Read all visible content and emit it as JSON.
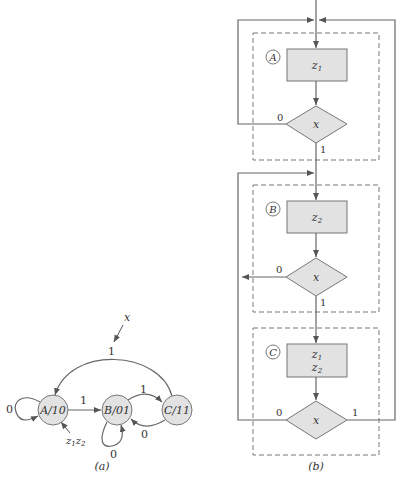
{
  "colors": {
    "fill": "#e2e2e2",
    "stroke": "#6e6e6e",
    "text": "#333333",
    "dashed": "#777777"
  },
  "state_diagram": {
    "label": "(a)",
    "input_label": "x",
    "output_label": "z1z2",
    "states": [
      {
        "id": "A",
        "label": "A/10",
        "name": "A",
        "output": "10"
      },
      {
        "id": "B",
        "label": "B/01",
        "name": "B",
        "output": "01"
      },
      {
        "id": "C",
        "label": "C/11",
        "name": "C",
        "output": "11"
      }
    ],
    "transitions": [
      {
        "from": "A",
        "to": "A",
        "label": "0"
      },
      {
        "from": "A",
        "to": "B",
        "label": "1"
      },
      {
        "from": "B",
        "to": "B",
        "label": "0"
      },
      {
        "from": "B",
        "to": "C",
        "label": "1"
      },
      {
        "from": "C",
        "to": "B",
        "label": "0"
      },
      {
        "from": "C",
        "to": "A",
        "label": "1"
      }
    ]
  },
  "asm_chart": {
    "label": "(b)",
    "blocks": [
      {
        "state": "A",
        "outputs": [
          "z1"
        ],
        "decision": "x",
        "branch0": "0",
        "branch1": "1"
      },
      {
        "state": "B",
        "outputs": [
          "z2"
        ],
        "decision": "x",
        "branch0": "0",
        "branch1": "1"
      },
      {
        "state": "C",
        "outputs": [
          "z1",
          "z2"
        ],
        "decision": "x",
        "branch0": "0",
        "branch1": "1"
      }
    ]
  }
}
